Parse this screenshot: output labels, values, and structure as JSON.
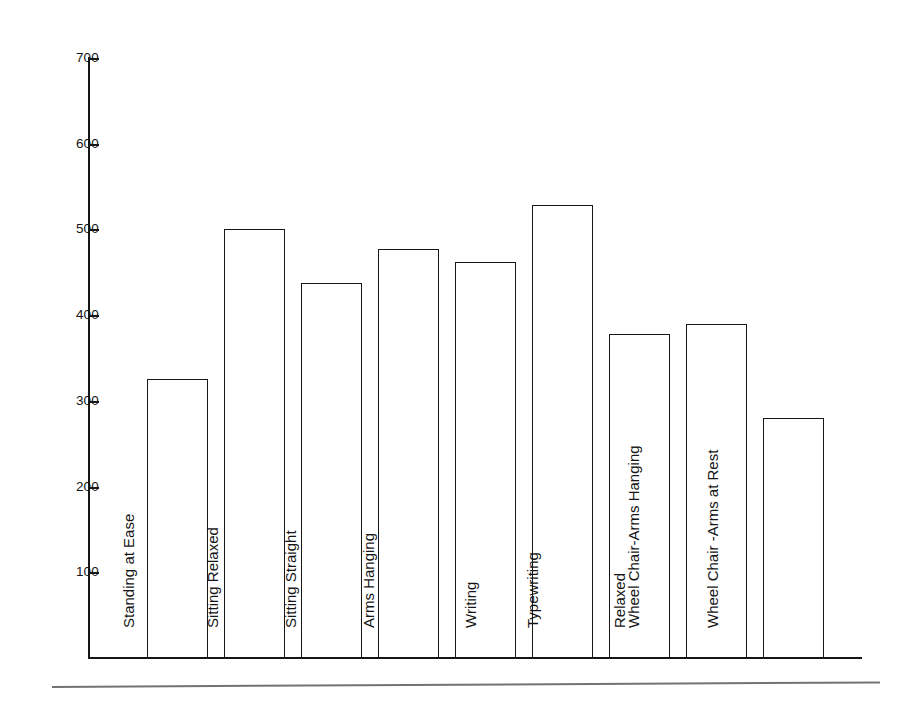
{
  "chart_data": {
    "type": "bar",
    "title": "",
    "subtitle": "",
    "xlabel": "",
    "ylabel": "",
    "categories": [
      "Standing at Ease",
      "Sitting Relaxed",
      "Sitting Straight",
      "Arms Hanging",
      "Writing",
      "Typewriting",
      "Relaxed",
      "Wheel Chair-Arms Hanging",
      "Wheel Chair -Arms at Rest"
    ],
    "values": [
      325,
      500,
      437,
      477,
      462,
      528,
      378,
      390,
      280
    ],
    "ylim": [
      0,
      700
    ],
    "yticks": [
      100,
      200,
      300,
      400,
      500,
      600,
      700
    ],
    "ytick_labels": [
      "100",
      "200",
      "300",
      "400",
      "500",
      "600",
      "700"
    ],
    "grid": false,
    "legend": false,
    "legend_position": "none",
    "bar_fill": "#ffffff",
    "bar_edge": "#171717",
    "axis_color": "#161616",
    "background": "#ffffff",
    "label_orientation": "vertical",
    "annotations": []
  },
  "figure": {
    "footer_rule_visible": true,
    "footer_rule_color": "#5a5a5a"
  }
}
